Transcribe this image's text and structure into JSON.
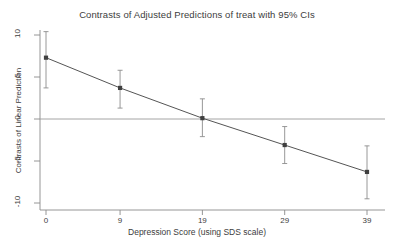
{
  "chart_data": {
    "type": "line",
    "title": "Contrasts of Adjusted Predictions of treat with 95% CIs",
    "xlabel": "Depression Score (using SDS scale)",
    "ylabel": "Contrasts of Linear Prediction",
    "x": [
      0,
      9,
      19,
      29,
      39
    ],
    "values": [
      7.3,
      3.7,
      0.1,
      -3.1,
      -6.3
    ],
    "ci_lower": [
      3.7,
      1.3,
      -2.1,
      -5.3,
      -9.5
    ],
    "ci_upper": [
      10.4,
      5.8,
      2.4,
      -0.9,
      -3.2
    ],
    "xticks": [
      0,
      9,
      19,
      29,
      39
    ],
    "xtick_labels": [
      "0",
      "9",
      "19",
      "29",
      "39"
    ],
    "yticks": [
      10,
      5,
      0,
      -5,
      -10
    ],
    "ytick_labels": [
      "10",
      "5",
      "0",
      "-5",
      "-10"
    ],
    "xlim": [
      -1.5,
      41
    ],
    "ylim": [
      -11.2,
      11.2
    ],
    "grid": false,
    "legend": null,
    "reference_line_y": 0,
    "series_name": "Contrast of treat",
    "marker": "square",
    "colors": {
      "line": "#555555",
      "marker": "#3f3f3f",
      "errorbar": "#8c8c8c",
      "axis": "#8a8a8a",
      "reference_line": "#9a9a9a",
      "background": "#ffffff",
      "text": "#3d3d3d"
    }
  }
}
